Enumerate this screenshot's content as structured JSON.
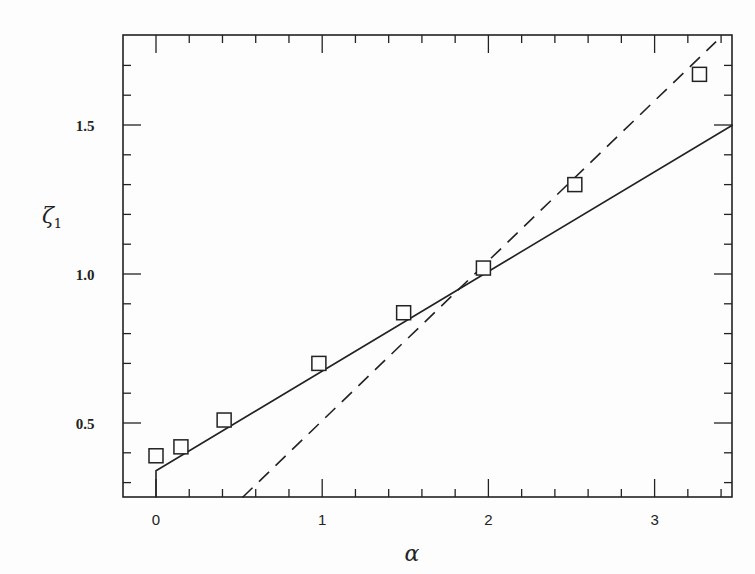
{
  "chart_data": {
    "type": "scatter",
    "title": "",
    "xlabel": "α",
    "ylabel": "ζ₁",
    "xlabel_text": "α",
    "ylabel_main": "ζ",
    "ylabel_sub": "1",
    "xlim": [
      -0.2,
      3.47
    ],
    "ylim": [
      0.25,
      1.8
    ],
    "grid": false,
    "legend": null,
    "x_ticks": [
      {
        "value": 0,
        "label": "0"
      },
      {
        "value": 1,
        "label": "1"
      },
      {
        "value": 2,
        "label": "2"
      },
      {
        "value": 3,
        "label": "3"
      }
    ],
    "x_minor_step": 0.2,
    "y_ticks": [
      {
        "value": 0.5,
        "label": "0.5"
      },
      {
        "value": 1.0,
        "label": "1.0"
      },
      {
        "value": 1.5,
        "label": "1.5"
      }
    ],
    "y_minor_step": 0.1,
    "series": [
      {
        "name": "data",
        "kind": "scatter",
        "marker": "open-square",
        "x": [
          0.0,
          0.15,
          0.41,
          0.98,
          1.49,
          1.97,
          2.52,
          3.27
        ],
        "y": [
          0.39,
          0.42,
          0.51,
          0.7,
          0.87,
          1.02,
          1.3,
          1.67
        ]
      },
      {
        "name": "solid-fit",
        "kind": "line",
        "style": "solid",
        "x": [
          0.0,
          0.0,
          3.47
        ],
        "y": [
          0.25,
          0.34,
          1.5
        ]
      },
      {
        "name": "dashed-fit",
        "kind": "line",
        "style": "dashed",
        "x": [
          0.52,
          3.37
        ],
        "y": [
          0.25,
          1.78
        ]
      }
    ]
  },
  "colors": {
    "ink": "#222222",
    "background": "#fdfdfd",
    "bleed_text": "#e6e6e6"
  }
}
